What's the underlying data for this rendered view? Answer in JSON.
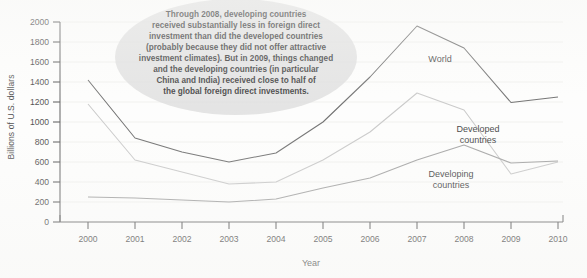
{
  "chart_data": {
    "type": "line",
    "title": "",
    "xlabel": "Year",
    "ylabel": "Billions of U.S. dollars",
    "x": [
      2000,
      2001,
      2002,
      2003,
      2004,
      2005,
      2006,
      2007,
      2008,
      2009,
      2010
    ],
    "xtick_labels": [
      "2000",
      "2001",
      "2002",
      "2003",
      "2004",
      "2005",
      "2006",
      "2007",
      "2008",
      "2009",
      "2010"
    ],
    "ytick_labels": [
      "0",
      "200",
      "400",
      "600",
      "800",
      "1000",
      "1200",
      "1400",
      "1600",
      "1800",
      "2000"
    ],
    "yticks": [
      0,
      200,
      400,
      600,
      800,
      1000,
      1200,
      1400,
      1600,
      1800,
      2000
    ],
    "xlim": [
      2000,
      2010
    ],
    "ylim": [
      0,
      2000
    ],
    "grid": true,
    "legend_position": "inline-labels",
    "series": [
      {
        "name": "World",
        "color": "#4d4d4d",
        "values": [
          1420,
          840,
          700,
          600,
          690,
          1000,
          1450,
          1960,
          1740,
          1195,
          1250
        ]
      },
      {
        "name": "Developed countries",
        "color": "#bcbcbc",
        "values": [
          1180,
          620,
          500,
          380,
          400,
          620,
          900,
          1290,
          1120,
          480,
          600
        ]
      },
      {
        "name": "Developing countries",
        "color": "#8f8f8f",
        "values": [
          250,
          240,
          220,
          200,
          230,
          340,
          440,
          620,
          770,
          590,
          610
        ]
      }
    ],
    "annotations": [
      {
        "id": "callout",
        "shape": "ellipse",
        "lines": [
          "Through 2008, developing countries",
          "received substantially less in foreign direct",
          "investment than did the developed countries",
          "(probably because they did not offer attractive",
          "investment climates).  But in 2009, things changed",
          "and the developing countries (in particular",
          "China and India) received close to half of",
          "the global foreign direct investments."
        ]
      }
    ]
  }
}
